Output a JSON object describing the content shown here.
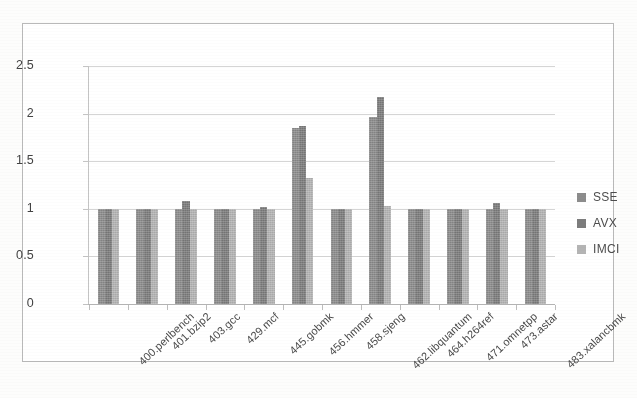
{
  "chart_data": {
    "type": "bar",
    "title": "",
    "subtitle": "",
    "xlabel": "",
    "ylabel": "",
    "ylim": [
      0,
      2.5
    ],
    "yticks": [
      0,
      0.5,
      1,
      1.5,
      2,
      2.5
    ],
    "ytick_labels": [
      "0",
      "0.5",
      "1",
      "1.5",
      "2",
      "2.5"
    ],
    "grid": true,
    "grid_axis": "y",
    "legend_position": "right",
    "categories": [
      "400.perlbench",
      "401.bzip2",
      "403.gcc",
      "429.mcf",
      "445.gobmk",
      "456.hmmer",
      "458.sjeng",
      "462.libquantum",
      "464.h264ref",
      "471.omnetpp",
      "473.astar",
      "483.xalancbmk"
    ],
    "series": [
      {
        "name": "SSE",
        "color": "#8c8c8c",
        "values": [
          1.0,
          1.0,
          1.0,
          1.0,
          1.0,
          1.85,
          1.0,
          1.96,
          1.0,
          1.0,
          1.0,
          1.0
        ]
      },
      {
        "name": "AVX",
        "color": "#7c7c7c",
        "values": [
          1.0,
          1.0,
          1.08,
          1.0,
          1.02,
          1.87,
          1.0,
          2.17,
          1.0,
          1.0,
          1.06,
          1.0
        ]
      },
      {
        "name": "IMCI",
        "color": "#b4b4b4",
        "values": [
          1.0,
          1.0,
          1.0,
          1.0,
          1.0,
          1.32,
          1.0,
          1.03,
          1.0,
          1.0,
          1.0,
          1.0
        ]
      }
    ]
  },
  "legend": {
    "items": [
      {
        "label": "SSE",
        "swatch": "legend-swatch-sse"
      },
      {
        "label": "AVX",
        "swatch": "legend-swatch-avx"
      },
      {
        "label": "IMCI",
        "swatch": "legend-swatch-imci"
      }
    ]
  }
}
